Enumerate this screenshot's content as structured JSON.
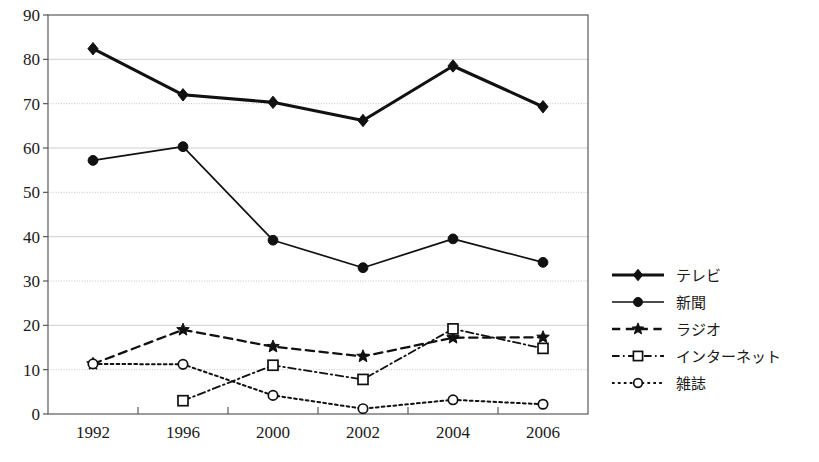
{
  "chart_data": {
    "type": "line",
    "title": "",
    "subtitle": "",
    "xlabel": "",
    "ylabel": "",
    "categories": [
      "1992",
      "1996",
      "2000",
      "2002",
      "2004",
      "2006"
    ],
    "ylim": [
      0,
      90
    ],
    "yticks": [
      0,
      10,
      20,
      30,
      40,
      50,
      60,
      70,
      80,
      90
    ],
    "ytick_labels": [
      "0",
      "10",
      "20",
      "30",
      "40",
      "50",
      "60",
      "70",
      "80",
      "90"
    ],
    "grid": true,
    "grid_axis": "y",
    "legend_position": "right",
    "series": [
      {
        "name": "テレビ",
        "values": [
          82.4,
          72.0,
          70.3,
          66.2,
          78.5,
          69.3
        ],
        "marker": "diamond-filled",
        "line_style": "solid",
        "line_width": 3.1,
        "color": "#111111"
      },
      {
        "name": "新聞",
        "values": [
          57.2,
          60.3,
          39.2,
          33.0,
          39.5,
          34.2
        ],
        "marker": "circle-filled",
        "line_style": "solid",
        "line_width": 1.7,
        "color": "#111111"
      },
      {
        "name": "ラジオ",
        "values": [
          11.3,
          19.0,
          15.2,
          13.0,
          17.2,
          17.3
        ],
        "marker": "star-filled",
        "line_style": "dashed",
        "line_width": 2.3,
        "color": "#111111"
      },
      {
        "name": "インターネット",
        "values": [
          null,
          3.0,
          11.0,
          7.8,
          19.2,
          14.8
        ],
        "marker": "square-open",
        "line_style": "dashdot",
        "line_width": 1.8,
        "color": "#111111"
      },
      {
        "name": "雑誌",
        "values": [
          11.3,
          11.2,
          4.2,
          1.2,
          3.2,
          2.2
        ],
        "marker": "circle-open",
        "line_style": "dotted",
        "line_width": 2.0,
        "color": "#111111"
      }
    ]
  },
  "plot": {
    "left": 48,
    "top": 15,
    "right": 588,
    "bottom": 414
  },
  "legend": {
    "x": 612,
    "y": 275,
    "row_height": 27,
    "sample_width": 52,
    "entries": [
      {
        "label": "テレビ"
      },
      {
        "label": "新聞"
      },
      {
        "label": "ラジオ"
      },
      {
        "label": "インターネット"
      },
      {
        "label": "雑誌"
      }
    ]
  },
  "colors": {
    "background": "#ffffff",
    "ink": "#111111",
    "border": "#5a5a5a",
    "grid": "#c9c9c9"
  }
}
